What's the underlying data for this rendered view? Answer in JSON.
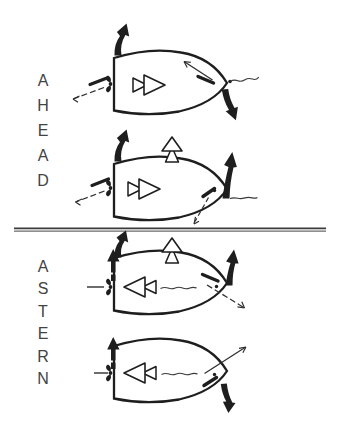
{
  "sections": {
    "ahead": {
      "label": "AHEAD",
      "letters": [
        "A",
        "H",
        "E",
        "A",
        "D"
      ]
    },
    "astern": {
      "label": "ASTERN",
      "letters": [
        "A",
        "S",
        "T",
        "E",
        "R",
        "N"
      ]
    }
  },
  "diagrams": [
    {
      "name": "ahead-boat-top",
      "section": "AHEAD"
    },
    {
      "name": "ahead-boat-bottom",
      "section": "AHEAD"
    },
    {
      "name": "astern-boat-top",
      "section": "ASTERN"
    },
    {
      "name": "astern-boat-bottom",
      "section": "ASTERN"
    }
  ],
  "icons": {
    "propeller-icon": "two-blade propeller glyph at transom",
    "thrust-direction-arrow": "open double-triangle arrow inside hull",
    "lift-arrow": "open outlined arrow pointing up above hull",
    "swing-arrow": "thick tapered comma arrow",
    "side-force-arrow": "bold dashed straight up arrow",
    "rudder-line": "short bold angled dash at bow quarter",
    "wash-arrow": "thin dashed arrow with open head",
    "wake-squiggle": "thin wavy flow line"
  },
  "colors": {
    "ink": "#1e1e1e",
    "label": "#434343",
    "paper": "#ffffff",
    "divider": "#4a4a4a"
  }
}
